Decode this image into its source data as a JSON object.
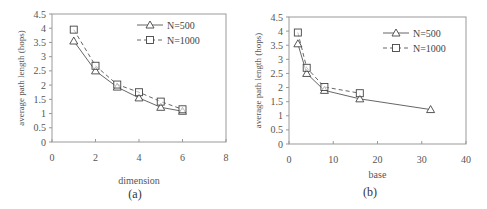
{
  "chart_data": [
    {
      "type": "line",
      "title": "",
      "caption": "(a)",
      "xlabel": "dimension",
      "ylabel": "average path length (hops)",
      "xlim": [
        0,
        8
      ],
      "ylim": [
        0,
        4.5
      ],
      "xticks": [
        "0",
        "2",
        "4",
        "6",
        "8"
      ],
      "yticks": [
        "0",
        "0.5",
        "1",
        "1.5",
        "2",
        "2.5",
        "3",
        "3.5",
        "4",
        "4.5"
      ],
      "grid": false,
      "legend_position": "upper right",
      "x": [
        1,
        2,
        3,
        4,
        5,
        6
      ],
      "series": [
        {
          "name": "N=500",
          "marker": "triangle",
          "line": "solid",
          "values": [
            3.55,
            2.5,
            1.93,
            1.55,
            1.22,
            1.08
          ]
        },
        {
          "name": "N=1000",
          "marker": "square",
          "line": "dashed",
          "values": [
            3.95,
            2.68,
            2.02,
            1.75,
            1.42,
            1.15
          ]
        }
      ]
    },
    {
      "type": "line",
      "title": "",
      "caption": "(b)",
      "xlabel": "base",
      "ylabel": "average path length (hops)",
      "xlim": [
        0,
        40
      ],
      "ylim": [
        0,
        4.5
      ],
      "xticks": [
        "0",
        "10",
        "20",
        "30",
        "40"
      ],
      "yticks": [
        "0",
        "0.5",
        "1",
        "1.5",
        "2",
        "2.5",
        "3",
        "3.5",
        "4",
        "4.5"
      ],
      "grid": false,
      "legend_position": "upper right",
      "series": [
        {
          "name": "N=500",
          "marker": "triangle",
          "line": "solid",
          "x": [
            2,
            4,
            8,
            16,
            32
          ],
          "values": [
            3.55,
            2.5,
            1.9,
            1.6,
            1.22
          ]
        },
        {
          "name": "N=1000",
          "marker": "square",
          "line": "dashed",
          "x": [
            2,
            4,
            8,
            16
          ],
          "values": [
            3.95,
            2.7,
            2.02,
            1.8
          ]
        }
      ]
    }
  ],
  "labels": {
    "a": {
      "caption": "(a)",
      "xlabel": "dimension",
      "ylabel": "average path length (hops)",
      "legend": [
        "N=500",
        "N=1000"
      ]
    },
    "b": {
      "caption": "(b)",
      "xlabel": "base",
      "ylabel": "average path length (hops)",
      "legend": [
        "N=500",
        "N=1000"
      ]
    }
  }
}
